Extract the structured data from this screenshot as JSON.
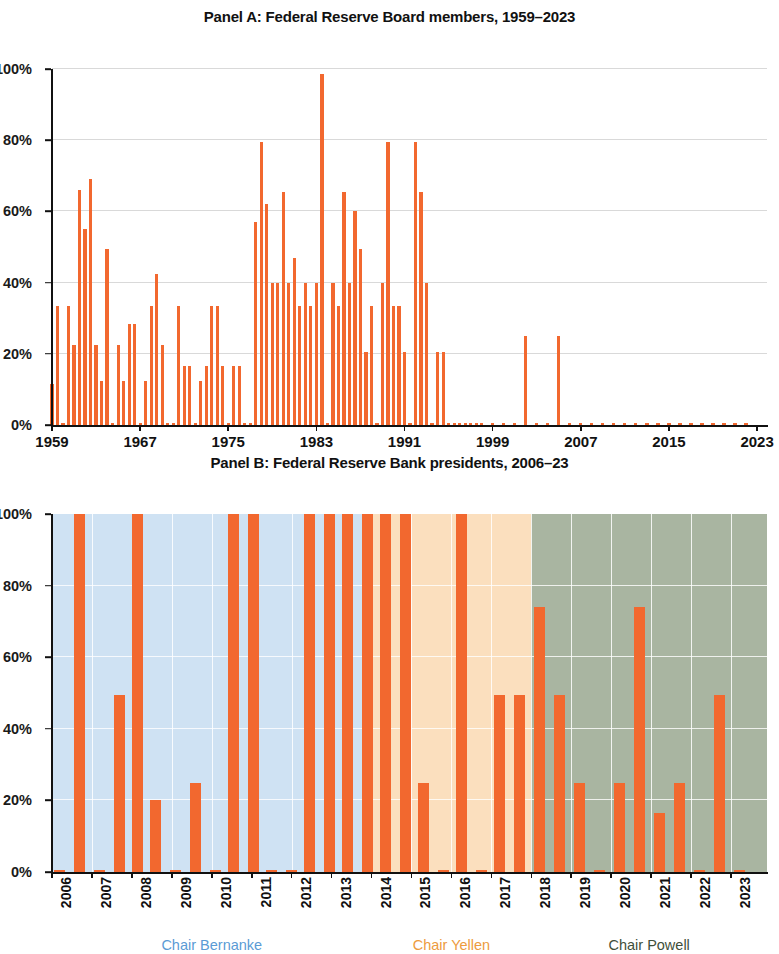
{
  "figure": {
    "bar_color": "#f2682f",
    "gridline_color": "#d9d9d9",
    "axis_color": "#111111"
  },
  "panel_a": {
    "title": "Panel A: Federal Reserve Board members, 1959–2023",
    "y_tick_labels": [
      "0%",
      "20%",
      "40%",
      "60%",
      "80%",
      "100%"
    ],
    "x_tick_labels": [
      "1959",
      "1967",
      "1975",
      "1983",
      "1991",
      "1999",
      "2007",
      "2015",
      "2023"
    ]
  },
  "panel_b": {
    "title": "Panel B: Federal Reserve Bank presidents, 2006–23",
    "y_tick_labels": [
      "0%",
      "20%",
      "40%",
      "60%",
      "80%",
      "100%"
    ],
    "x_tick_labels": [
      "2006",
      "2007",
      "2008",
      "2009",
      "2010",
      "2011",
      "2012",
      "2013",
      "2014",
      "2015",
      "2016",
      "2017",
      "2018",
      "2019",
      "2020",
      "2021",
      "2022",
      "2023"
    ],
    "eras": [
      {
        "label": "Chair Bernanke",
        "color": "#5b9bd5",
        "band_color": "#cfe2f3",
        "start": 2006,
        "end": 2014
      },
      {
        "label": "Chair Yellen",
        "color": "#ed9b3e",
        "band_color": "#fbdfbe",
        "start": 2014,
        "end": 2018
      },
      {
        "label": "Chair Powell",
        "color": "#3f4f3a",
        "band_color": "#a9b5a1",
        "start": 2018,
        "end": 2023.9
      }
    ]
  },
  "chart_data": [
    {
      "type": "bar",
      "title": "Panel A: Federal Reserve Board members, 1959–2023",
      "xlabel": "",
      "ylabel": "",
      "ylim": [
        0,
        100
      ],
      "xlim": [
        1959,
        2023.9
      ],
      "yticks": [
        0,
        20,
        40,
        60,
        80,
        100
      ],
      "xticks": [
        1959,
        1967,
        1975,
        1983,
        1991,
        1999,
        2007,
        2015,
        2023
      ],
      "grid": true,
      "legend": "none",
      "x": [
        1959,
        1959.5,
        1960,
        1960.5,
        1961,
        1961.5,
        1962,
        1962.5,
        1963,
        1963.5,
        1964,
        1964.5,
        1965,
        1965.5,
        1966,
        1966.5,
        1967,
        1967.5,
        1968,
        1968.5,
        1969,
        1969.5,
        1970,
        1970.5,
        1971,
        1971.5,
        1972,
        1972.5,
        1973,
        1973.5,
        1974,
        1974.5,
        1975,
        1975.5,
        1976,
        1976.5,
        1977,
        1977.5,
        1978,
        1978.5,
        1979,
        1979.5,
        1980,
        1980.5,
        1981,
        1981.5,
        1982,
        1982.5,
        1983,
        1983.5,
        1984,
        1984.5,
        1985,
        1985.5,
        1986,
        1986.5,
        1987,
        1987.5,
        1988,
        1988.5,
        1989,
        1989.5,
        1990,
        1990.5,
        1991,
        1991.5,
        1992,
        1992.5,
        1993,
        1993.5,
        1994,
        1994.5,
        1995,
        1995.5,
        1996,
        1996.5,
        1997,
        1997.5,
        1998,
        1999,
        2000,
        2001,
        2002,
        2003,
        2004,
        2005,
        2006,
        2007,
        2008,
        2009,
        2010,
        2011,
        2012,
        2013,
        2014,
        2015,
        2016,
        2017,
        2018,
        2019,
        2020,
        2021,
        2022,
        2023
      ],
      "values": [
        11.5,
        33.5,
        0.5,
        33.5,
        22.5,
        66,
        55,
        69,
        22.5,
        12.5,
        49.5,
        0.5,
        22.5,
        12.5,
        28.5,
        28.5,
        0.5,
        12.5,
        33.5,
        42.5,
        22.5,
        0.5,
        0.5,
        33.5,
        16.5,
        16.5,
        0.5,
        12.5,
        16.5,
        33.5,
        33.5,
        16.5,
        0.5,
        16.5,
        16.5,
        0.5,
        0.5,
        57,
        79.5,
        62,
        40,
        40,
        65.5,
        40,
        47,
        33.5,
        40,
        33.5,
        40,
        98.5,
        0.5,
        40,
        33.5,
        65.5,
        40,
        60,
        49.5,
        20.5,
        33.5,
        0.5,
        40,
        79.5,
        33.5,
        33.5,
        20.5,
        0.5,
        79.5,
        65.5,
        40,
        0.5,
        20.5,
        20.5,
        0.5,
        0.5,
        0.5,
        0.5,
        0.5,
        0.5,
        0.5,
        0.5,
        0.5,
        0.5,
        25,
        0.5,
        0.5,
        25,
        0.5,
        0.5,
        0.5,
        0.5,
        0.5,
        0.5,
        0.5,
        0.5,
        0.5,
        0.5,
        0.5,
        0.5,
        0.5,
        0.5,
        0.5,
        0.5,
        0.5
      ]
    },
    {
      "type": "bar",
      "title": "Panel B: Federal Reserve Bank presidents, 2006–23",
      "xlabel": "",
      "ylabel": "",
      "ylim": [
        0,
        100
      ],
      "xlim": [
        2006,
        2023.9
      ],
      "yticks": [
        0,
        20,
        40,
        60,
        80,
        100
      ],
      "xticks": [
        2006,
        2007,
        2008,
        2009,
        2010,
        2011,
        2012,
        2013,
        2014,
        2015,
        2016,
        2017,
        2018,
        2019,
        2020,
        2021,
        2022,
        2023
      ],
      "grid": true,
      "legend": "none",
      "categories": [
        "2006",
        "2006.5",
        "2007",
        "2007.5",
        "2008",
        "2008.5",
        "2009",
        "2009.5",
        "2010",
        "2010.5",
        "2011",
        "2011.5",
        "2012",
        "2012.5",
        "2013",
        "2013.5",
        "2014",
        "2014.5",
        "2015",
        "2015.5",
        "2016",
        "2016.5",
        "2017",
        "2017.5",
        "2018",
        "2018.5",
        "2019",
        "2019.5",
        "2020",
        "2020.5",
        "2021",
        "2021.5",
        "2022",
        "2022.5",
        "2023",
        "2023.5"
      ],
      "x": [
        2006.2,
        2006.7,
        2007.2,
        2007.7,
        2008.15,
        2008.6,
        2009.1,
        2009.6,
        2010.1,
        2010.55,
        2011.05,
        2011.5,
        2012.0,
        2012.45,
        2012.95,
        2013.4,
        2013.9,
        2014.35,
        2014.85,
        2015.3,
        2015.8,
        2016.25,
        2016.75,
        2017.2,
        2017.7,
        2018.2,
        2018.7,
        2019.2,
        2019.7,
        2020.2,
        2020.7,
        2021.2,
        2021.7,
        2022.2,
        2022.7,
        2023.2
      ],
      "values": [
        0.7,
        100,
        0.7,
        49.5,
        100,
        20,
        0.7,
        25,
        0.7,
        100,
        100,
        0.7,
        0.7,
        100,
        100,
        100,
        100,
        100,
        100,
        25,
        0.7,
        100,
        0.7,
        49.5,
        49.5,
        74,
        49.5,
        25,
        0.7,
        25,
        74,
        16.5,
        25,
        0.7,
        49.5,
        0.7
      ],
      "annotations": [
        "Chair Bernanke",
        "Chair Yellen",
        "Chair Powell"
      ]
    }
  ]
}
